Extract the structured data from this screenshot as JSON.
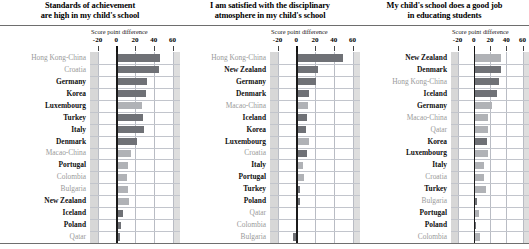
{
  "figure": {
    "axis_caption": "Score point difference",
    "tick_labels": [
      "-20",
      "0",
      "20",
      "40",
      "60"
    ],
    "axis_min": -28,
    "axis_max": 68,
    "colors": {
      "bar_dark": "#6f7176",
      "bar_light": "#b0b2b6",
      "gridline": "#b9bcc4",
      "zeroline": "#1b1b1b",
      "band": "#c9c9c9",
      "label_highlight": "#111111",
      "label_dim": "#9a9a9a"
    }
  },
  "chart_data": {
    "type": "bar",
    "xlabel": "Score point difference",
    "ylabel": "",
    "xlim": [
      -28,
      68
    ],
    "ticks": [
      -20,
      0,
      20,
      40,
      60
    ],
    "grid": true,
    "legend": "none",
    "orientation": "horizontal",
    "panels": [
      {
        "title_line1": "Standards of achievement",
        "title_line2": "are high in my child's school",
        "categories": [
          "Hong Kong-China",
          "Croatia",
          "Germany",
          "Korea",
          "Luxembourg",
          "Turkey",
          "Italy",
          "Denmark",
          "Macao-China",
          "Portugal",
          "Colombia",
          "Bulgaria",
          "New Zealand",
          "Iceland",
          "Poland",
          "Qatar"
        ],
        "values": [
          47,
          46,
          33,
          32,
          27,
          29,
          30,
          22,
          16,
          13,
          11,
          12,
          14,
          7,
          5,
          4
        ],
        "highlight": [
          false,
          false,
          true,
          true,
          true,
          true,
          true,
          true,
          false,
          true,
          false,
          false,
          true,
          true,
          true,
          false
        ],
        "shade": [
          "dark",
          "dark",
          "dark",
          "dark",
          "light",
          "dark",
          "dark",
          "dark",
          "light",
          "light",
          "light",
          "light",
          "light",
          "dark",
          "dark",
          "dark"
        ]
      },
      {
        "title_line1": "I am satisfied with the disciplinary",
        "title_line2": "atmosphere in my child's school",
        "categories": [
          "Hong Kong-China",
          "New Zealand",
          "Germany",
          "Denmark",
          "Macao-China",
          "Iceland",
          "Korea",
          "Luxembourg",
          "Croatia",
          "Italy",
          "Portugal",
          "Turkey",
          "Poland",
          "Qatar",
          "Colombia",
          "Bulgaria"
        ],
        "values": [
          50,
          23,
          21,
          14,
          13,
          11,
          10,
          14,
          11,
          7,
          8,
          4,
          4,
          1,
          0,
          -4
        ],
        "highlight": [
          false,
          true,
          true,
          true,
          false,
          true,
          true,
          true,
          false,
          true,
          true,
          true,
          true,
          false,
          false,
          false
        ],
        "shade": [
          "dark",
          "dark",
          "dark",
          "dark",
          "light",
          "dark",
          "dark",
          "light",
          "dark",
          "light",
          "light",
          "dark",
          "dark",
          "dark",
          "light",
          "dark"
        ]
      },
      {
        "title_line1": "My child's school does a good job",
        "title_line2": "in educating students",
        "categories": [
          "New Zealand",
          "Denmark",
          "Hong Kong-China",
          "Iceland",
          "Germany",
          "Macao-China",
          "Qatar",
          "Korea",
          "Luxembourg",
          "Italy",
          "Croatia",
          "Turkey",
          "Bulgaria",
          "Portugal",
          "Poland",
          "Colombia"
        ],
        "values": [
          33,
          34,
          31,
          28,
          23,
          18,
          17,
          16,
          18,
          13,
          12,
          15,
          4,
          7,
          3,
          8
        ],
        "highlight": [
          true,
          true,
          false,
          true,
          true,
          false,
          false,
          true,
          true,
          true,
          false,
          true,
          false,
          true,
          true,
          false
        ],
        "shade": [
          "light",
          "dark",
          "dark",
          "dark",
          "light",
          "light",
          "light",
          "dark",
          "light",
          "light",
          "light",
          "light",
          "dark",
          "light",
          "dark",
          "light"
        ]
      }
    ]
  }
}
